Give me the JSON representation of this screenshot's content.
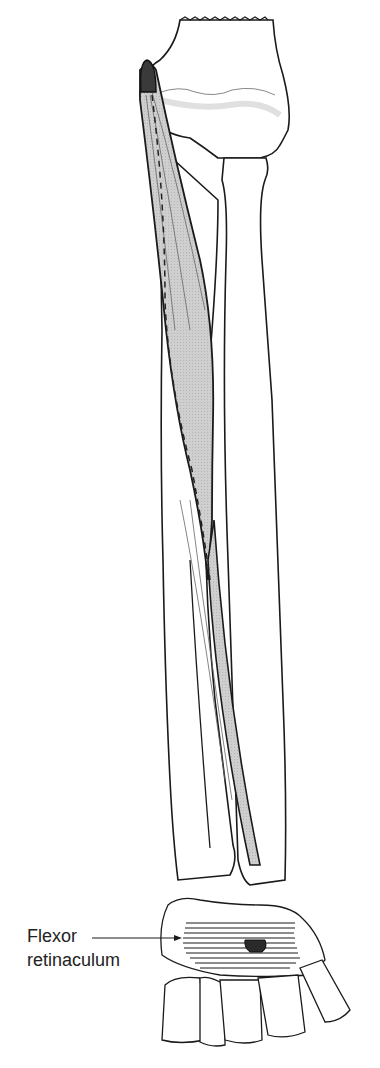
{
  "figure": {
    "colors": {
      "outline": "#1a1a1a",
      "muscle_fill": "#c8c8c8",
      "origin_fill": "#3a3a3a",
      "insertion_fill": "#2a2a2a",
      "bone_fill": "#ffffff",
      "bone_shadow": "#ececec"
    },
    "labels": [
      {
        "line1": "Flexor",
        "line2": "retinaculum"
      }
    ]
  }
}
